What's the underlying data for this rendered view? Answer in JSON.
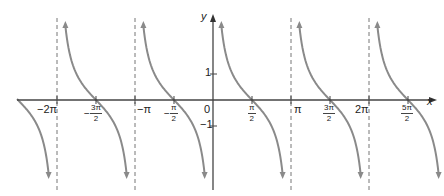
{
  "chart_data": {
    "type": "line",
    "title": "",
    "function": "y = cot x",
    "xlabel": "x",
    "ylabel": "y",
    "xlim": [
      -2.5,
      5.8
    ],
    "ylim": [
      -2.9,
      2.9
    ],
    "grid": false,
    "legend": null,
    "x_tick_labels": [
      "−2π",
      "−3π/2",
      "−π",
      "−π/2",
      "0",
      "π/2",
      "π",
      "3π/2",
      "2π",
      "5π/2"
    ],
    "x_tick_values": [
      -6.2832,
      -4.7124,
      -3.1416,
      -1.5708,
      0,
      1.5708,
      3.1416,
      4.7124,
      6.2832,
      7.854
    ],
    "y_tick_labels": [
      "1",
      "−1"
    ],
    "y_tick_values": [
      1,
      -1
    ],
    "asymptotes": [
      "x = −2π",
      "x = −π",
      "x = 0",
      "x = π",
      "x = 2π"
    ],
    "zeros": [
      "−3π/2",
      "−π/2",
      "π/2",
      "3π/2",
      "5π/2"
    ],
    "series": [
      {
        "name": "cot x",
        "color": "#8a8a8a",
        "sample_points": [
          {
            "x": "−π/4",
            "y": -1
          },
          {
            "x": "π/4",
            "y": 1
          },
          {
            "x": "π/2",
            "y": 0
          },
          {
            "x": "3π/4",
            "y": -1
          }
        ]
      }
    ]
  },
  "labels": {
    "y_axis": "y",
    "x_axis": "x",
    "neg2pi": "−2π",
    "negpi": "−π",
    "pi": "π",
    "twopi": "2π",
    "zero": "0",
    "one": "1",
    "negone": "−1",
    "pi_sym": "π",
    "two": "2",
    "three_pi": "3π",
    "five_pi": "5π",
    "minus": "−"
  },
  "colors": {
    "curve": "#8a8a8a",
    "axis": "#444444",
    "asymptote": "#777777"
  }
}
